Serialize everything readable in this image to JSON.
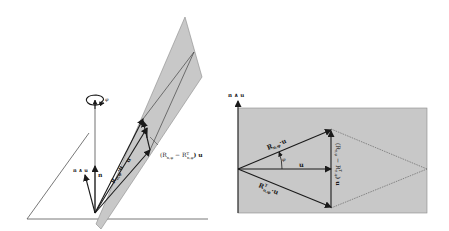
{
  "figure": {
    "left_panel": {
      "labels": {
        "phi": "φ",
        "n": "n",
        "n_wedge_u": "n ∧ u",
        "R_u": "R",
        "R_u_sub": "n,φ",
        "R_u_tail": "·u",
        "u": "u",
        "diff_open": "(R",
        "diff_sub1": "n,φ",
        "diff_minus": " − R",
        "diff_sup": "T",
        "diff_sub2": "n,φ",
        "diff_close": ") u"
      }
    },
    "right_panel": {
      "labels": {
        "axis": "n ∧ u",
        "R_u": "R",
        "R_u_sub": "n,φ",
        "R_u_tail": "·u",
        "phi": "φ",
        "u": "u",
        "RT": "R",
        "RT_sup": "T",
        "RT_sub": "n,φ",
        "RT_tail": "·u",
        "diff": "(R",
        "diff_sub1": "n,φ",
        "diff_mid": " − R",
        "diff_sup": "T",
        "diff_sub2": "n,φ",
        "diff_close": ") u"
      }
    },
    "colors": {
      "plane_fill": "#c8c8c8",
      "plane_edge": "#8a8a8a",
      "line": "#222222",
      "thin_line": "#555555"
    }
  }
}
